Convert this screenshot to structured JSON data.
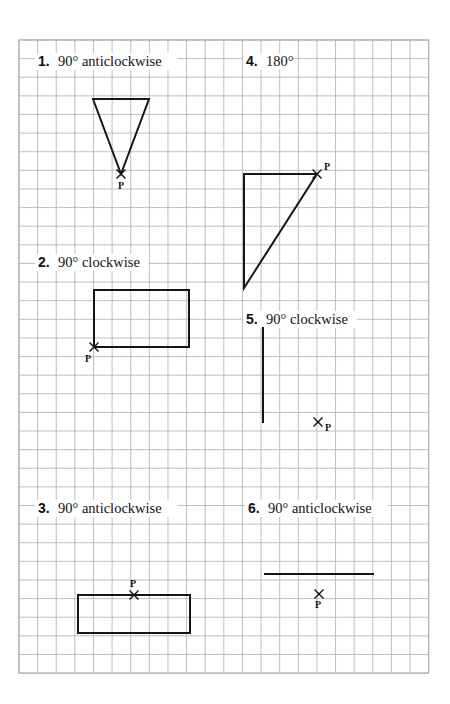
{
  "worksheet": {
    "grid": {
      "left": 19,
      "top": 40,
      "cell": 18.62,
      "cols": 22,
      "rows": 34,
      "line_color": "#b8b8b8",
      "border_color": "#a8a8a8"
    },
    "ink_color": "#151515",
    "questions": [
      {
        "number": "1.",
        "instruction": "90° anticlockwise",
        "label_pos": [
          38,
          66
        ],
        "shape": "triangle",
        "points": [
          [
            93,
            99
          ],
          [
            149,
            99
          ],
          [
            121,
            174
          ]
        ],
        "centre_label": "P",
        "centre": [
          121,
          174
        ],
        "centre_label_offset": [
          -3,
          15
        ]
      },
      {
        "number": "2.",
        "instruction": "90° clockwise",
        "label_pos": [
          38,
          267
        ],
        "shape": "rectangle",
        "points": [
          [
            94,
            290
          ],
          [
            189,
            290
          ],
          [
            189,
            347
          ],
          [
            94,
            347
          ]
        ],
        "centre_label": "P",
        "centre": [
          94,
          347
        ],
        "centre_label_offset": [
          -9,
          15
        ]
      },
      {
        "number": "3.",
        "instruction": "90° anticlockwise",
        "label_pos": [
          38,
          513
        ],
        "shape": "rectangle",
        "points": [
          [
            78,
            595
          ],
          [
            190,
            595
          ],
          [
            190,
            633
          ],
          [
            78,
            633
          ]
        ],
        "centre_label": "P",
        "centre": [
          134,
          595
        ],
        "centre_label_offset": [
          -4,
          -8
        ]
      },
      {
        "number": "4.",
        "instruction": "180°",
        "label_pos": [
          246,
          66
        ],
        "shape": "triangle",
        "points": [
          [
            244,
            174
          ],
          [
            317,
            174
          ],
          [
            244,
            288
          ]
        ],
        "centre_label": "P",
        "centre": [
          317,
          174
        ],
        "centre_label_offset": [
          7,
          -4
        ]
      },
      {
        "number": "5.",
        "instruction": "90° clockwise",
        "label_pos": [
          246,
          324
        ],
        "shape": "segment",
        "points": [
          [
            263,
            327
          ],
          [
            263,
            423
          ]
        ],
        "centre_label": "P",
        "centre": [
          318,
          422
        ],
        "centre_label_offset": [
          7,
          9
        ]
      },
      {
        "number": "6.",
        "instruction": "90° anticlockwise",
        "label_pos": [
          248,
          513
        ],
        "shape": "segment",
        "points": [
          [
            264,
            574
          ],
          [
            374,
            574
          ]
        ],
        "centre_label": "P",
        "centre": [
          319,
          594
        ],
        "centre_label_offset": [
          -4,
          14
        ]
      }
    ]
  }
}
